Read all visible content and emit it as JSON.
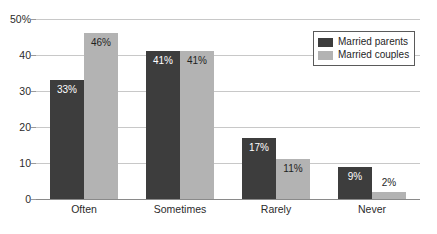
{
  "chart_data": {
    "type": "bar",
    "title": "",
    "subtitle": "",
    "xlabel": "",
    "ylabel": "",
    "categories": [
      "Often",
      "Sometimes",
      "Rarely",
      "Never"
    ],
    "series": [
      {
        "name": "Married parents",
        "color": "#3d3d3d",
        "values": [
          33,
          41,
          17,
          9
        ],
        "labels": [
          "33%",
          "41%",
          "17%",
          "9%"
        ]
      },
      {
        "name": "Married couples",
        "color": "#b3b3b3",
        "values": [
          46,
          41,
          11,
          2
        ],
        "labels": [
          "46%",
          "41%",
          "11%",
          "2%"
        ]
      }
    ],
    "ylim": [
      0,
      50
    ],
    "y_ticks": [
      0,
      10,
      20,
      30,
      40,
      50
    ],
    "y_tick_labels": [
      "0",
      "10",
      "20",
      "30",
      "40",
      "50%"
    ],
    "grid": true,
    "legend_position": "top-right",
    "bar_value_suffix": "%"
  },
  "legend": {
    "items": [
      {
        "label": "Married parents",
        "color": "#3d3d3d"
      },
      {
        "label": "Married couples",
        "color": "#b3b3b3"
      }
    ]
  },
  "colors": {
    "series_dark": "#3d3d3d",
    "series_light": "#b3b3b3",
    "gridline": "#c8c8c8",
    "axis": "#8a8a8a",
    "background": "#ffffff",
    "text": "#1f1f1f"
  }
}
